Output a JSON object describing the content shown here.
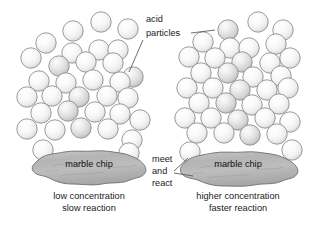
{
  "diagram": {
    "background_color": "#ffffff",
    "particle_fill": "#f2f2f2",
    "particle_stroke": "#8a8a8a",
    "chip_fill": "#b5b5b5",
    "chip_stroke": "#6e6e6e",
    "text_color": "#1a1a1a",
    "leader_color": "#4a4a4a"
  },
  "annotations": {
    "acid_particles_line1": "acid",
    "acid_particles_line2": "particles",
    "meet_line1": "meet",
    "meet_line2": "and",
    "meet_line3": "react"
  },
  "panels": [
    {
      "id": "left",
      "chip_label": "marble chip",
      "caption_line1": "low concentration",
      "caption_line2": "slow reaction",
      "particle_count": 33,
      "concentration": "low",
      "reaction_rate": "slow"
    },
    {
      "id": "right",
      "chip_label": "marble chip",
      "caption_line1": "higher concentration",
      "caption_line2": "faster reaction",
      "particle_count": 36,
      "concentration": "higher",
      "reaction_rate": "faster"
    }
  ],
  "left_particles": [
    [
      73,
      31
    ],
    [
      101,
      22
    ],
    [
      128,
      29
    ],
    [
      46,
      43
    ],
    [
      72,
      53
    ],
    [
      99,
      50
    ],
    [
      118,
      50
    ],
    [
      31,
      58
    ],
    [
      59,
      66
    ],
    [
      86,
      62
    ],
    [
      113,
      63
    ],
    [
      133,
      77
    ],
    [
      39,
      81
    ],
    [
      66,
      83
    ],
    [
      93,
      80
    ],
    [
      120,
      82
    ],
    [
      27,
      97
    ],
    [
      52,
      96
    ],
    [
      79,
      97
    ],
    [
      107,
      96
    ],
    [
      128,
      98
    ],
    [
      41,
      113
    ],
    [
      68,
      111
    ],
    [
      95,
      112
    ],
    [
      120,
      114
    ],
    [
      140,
      120
    ],
    [
      27,
      129
    ],
    [
      55,
      130
    ],
    [
      81,
      128
    ],
    [
      108,
      129
    ],
    [
      132,
      140
    ],
    [
      43,
      150
    ],
    [
      129,
      153
    ]
  ],
  "right_particles": [
    [
      228,
      30
    ],
    [
      258,
      22
    ],
    [
      283,
      30
    ],
    [
      203,
      42
    ],
    [
      230,
      48
    ],
    [
      249,
      48
    ],
    [
      276,
      44
    ],
    [
      189,
      57
    ],
    [
      215,
      58
    ],
    [
      242,
      62
    ],
    [
      270,
      63
    ],
    [
      290,
      58
    ],
    [
      201,
      73
    ],
    [
      228,
      73
    ],
    [
      253,
      77
    ],
    [
      281,
      76
    ],
    [
      187,
      88
    ],
    [
      213,
      88
    ],
    [
      240,
      90
    ],
    [
      267,
      90
    ],
    [
      288,
      88
    ],
    [
      199,
      103
    ],
    [
      226,
      103
    ],
    [
      252,
      105
    ],
    [
      279,
      104
    ],
    [
      185,
      118
    ],
    [
      211,
      118
    ],
    [
      238,
      120
    ],
    [
      265,
      118
    ],
    [
      290,
      122
    ],
    [
      197,
      133
    ],
    [
      224,
      133
    ],
    [
      250,
      135
    ],
    [
      277,
      134
    ],
    [
      190,
      152
    ],
    [
      292,
      150
    ]
  ]
}
